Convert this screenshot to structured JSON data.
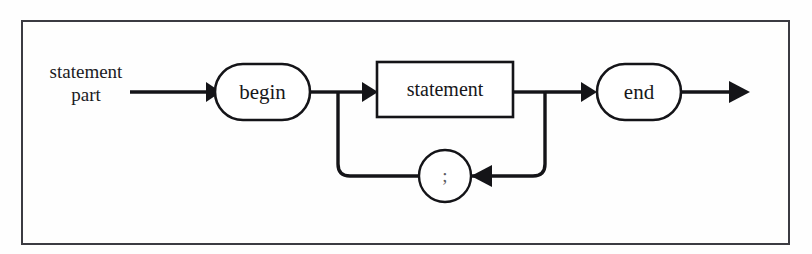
{
  "figure": {
    "kind": "railroad-syntax-diagram",
    "rule_name": "statement part",
    "entry_label_line1": "statement",
    "entry_label_line2": "part",
    "frame": {
      "x": 21,
      "y": 20,
      "width": 769,
      "height": 225,
      "stroke": "#3b3b42"
    },
    "background": "#fefefe",
    "ink": "#141418"
  },
  "nodes": {
    "begin": {
      "label": "begin",
      "shape": "stadium",
      "x": 215,
      "y": 64,
      "width": 95,
      "height": 56
    },
    "statement": {
      "label": "statement",
      "shape": "rectangle",
      "x": 377,
      "y": 62,
      "width": 136,
      "height": 55
    },
    "end": {
      "label": "end",
      "shape": "stadium",
      "x": 597,
      "y": 64,
      "width": 84,
      "height": 56
    },
    "semicolon": {
      "label": ";",
      "shape": "circle",
      "cx": 445,
      "cy": 176,
      "r": 26
    }
  },
  "rails": {
    "main_y": 92,
    "loop_y": 176,
    "entry_start_x": 130,
    "exit_end_x": 748,
    "left_junction_x": 338,
    "right_junction_x": 545
  },
  "arrows": [
    {
      "name": "entry-arrow",
      "x": 213,
      "y": 92,
      "direction": "right"
    },
    {
      "name": "statement-arrow",
      "x": 376,
      "y": 92,
      "direction": "right"
    },
    {
      "name": "end-arrow",
      "x": 595,
      "y": 92,
      "direction": "right"
    },
    {
      "name": "exit-arrow",
      "x": 748,
      "y": 92,
      "direction": "right"
    },
    {
      "name": "loop-arrow",
      "x": 476,
      "y": 176,
      "direction": "left"
    }
  ]
}
